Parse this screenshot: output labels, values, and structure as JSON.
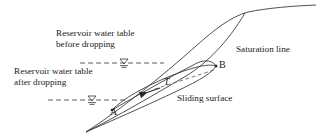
{
  "figure": {
    "background_color": "#ffffff",
    "line_color": "#3d3d3d",
    "text_color": "#1a1a1a"
  },
  "labels": {
    "water_table_before_line1": "Reservoir water table",
    "water_table_before_line2": "before dropping",
    "water_table_after_line1": "Reservoir water table",
    "water_table_after_line2": "after dropping",
    "saturation_line": "Saturation line",
    "sliding_surface": "Sliding surface",
    "point_a": "A",
    "point_b": "B",
    "force_t": "T"
  },
  "geometry": {
    "ground_surface_path": "M 86 132 C 120 110, 160 78, 196 46 C 214 30, 230 17, 248 12 C 268 8, 292 6, 316 5",
    "saturation_line_path": "M 86 132 C 118 116, 152 96, 186 76 C 206 64, 228 42, 245 13",
    "sliding_surface_path": "M 86 132 C 104 124, 130 112, 158 99 C 186 86, 208 76, 216 66",
    "slip_upper_path": "M 112 110 C 140 94, 172 76, 198 62 C 206 58, 212 60, 216 66",
    "slip_lower_path": "M 112 110 C 122 97, 142 86, 166 76 C 188 67, 206 62, 216 66",
    "water_table_before_dash": "M 80 63 L 164 63",
    "water_table_after_dash": "M 48 100 L 126 100",
    "force_arrow_path": "M 214 70 L 135 96",
    "point_a_coords": [
      112,
      110
    ],
    "point_b_coords": [
      216,
      66
    ],
    "wt_symbol_before_x": 124,
    "wt_symbol_before_y": 63,
    "wt_symbol_after_x": 92,
    "wt_symbol_after_y": 100
  }
}
